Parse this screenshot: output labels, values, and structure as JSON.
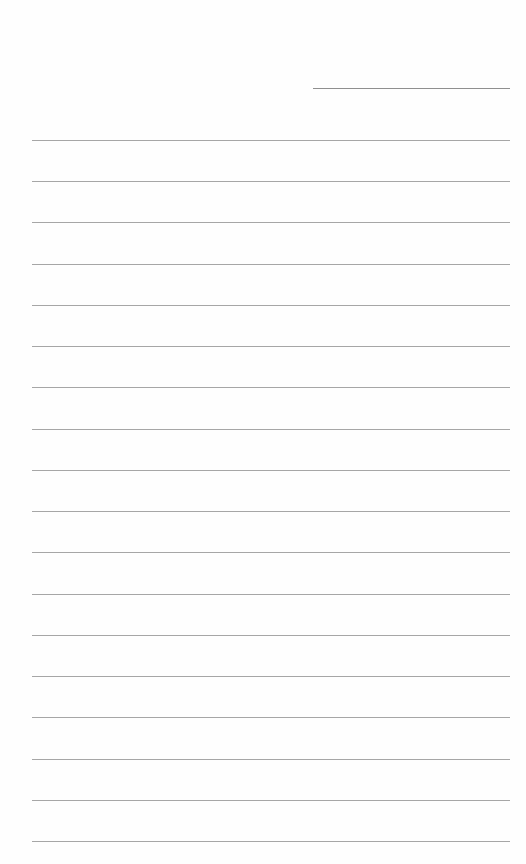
{
  "page": {
    "type": "lined-paper",
    "background": "#fefefe",
    "header_line": {
      "label": "",
      "x": 313,
      "y": 88,
      "width": 197,
      "color": "#8f8f8f"
    },
    "rules": {
      "count": 18,
      "x": 32,
      "width": 478,
      "first_y": 140,
      "last_y": 841,
      "color": "#a6a6a6"
    },
    "lines_text": [
      "",
      "",
      "",
      "",
      "",
      "",
      "",
      "",
      "",
      "",
      "",
      "",
      "",
      "",
      "",
      "",
      "",
      ""
    ]
  }
}
